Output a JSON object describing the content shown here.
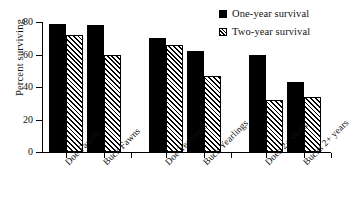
{
  "chart_data": {
    "type": "bar",
    "title": "",
    "xlabel": "",
    "ylabel": "Percent surviving",
    "ylim": [
      0,
      80
    ],
    "yticks": [
      0,
      20,
      40,
      60,
      80
    ],
    "grid": false,
    "legend_position": "top-right",
    "categories": [
      "Doe Fawns",
      "Buck Fawns",
      "Doe Yearlings",
      "Buck Yearlings",
      "Does 2+ years",
      "Bucks 2+ years"
    ],
    "series": [
      {
        "name": "One-year survival",
        "style": "solid-black",
        "values": [
          79,
          78,
          70,
          62,
          60,
          43
        ]
      },
      {
        "name": "Two-year survival",
        "style": "diagonal-hatch",
        "values": [
          72,
          60,
          66,
          47,
          32,
          34
        ]
      }
    ]
  },
  "legend": {
    "items": [
      {
        "label": "One-year survival",
        "swatch": "solid-square-icon"
      },
      {
        "label": "Two-year survival",
        "swatch": "hatched-square-icon"
      }
    ]
  },
  "axes": {
    "y": {
      "label": "Percent surviving",
      "ticks": [
        "0",
        "20",
        "40",
        "60",
        "80"
      ]
    },
    "x": {
      "ticks": [
        "Doe Fawns",
        "Buck Fawns",
        "Doe Yearlings",
        "Buck Yearlings",
        "Does 2+ years",
        "Bucks 2+ years"
      ]
    }
  },
  "colors": {
    "series_one": "#000000",
    "series_two": "#ffffff",
    "axis": "#000000",
    "background": "#ffffff"
  }
}
